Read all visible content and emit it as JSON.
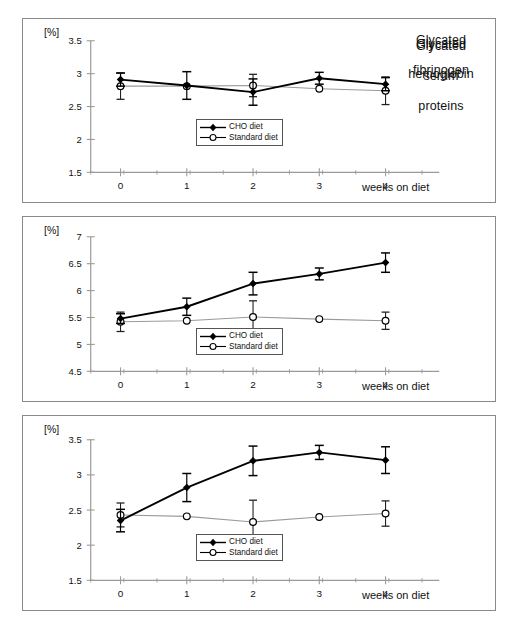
{
  "figure": {
    "unit_label": "[%]",
    "x_axis_title": "weeks on diet",
    "legend": {
      "series1_label": "CHO diet",
      "series2_label": "Standard diet",
      "series1_marker": "filled-diamond-icon",
      "series2_marker": "open-circle-icon"
    },
    "colors": {
      "series1": "#000000",
      "series2": "#000000",
      "series2_line": "#9a9a9a",
      "axis": "#9a9a9a",
      "frame": "#8a8a8a",
      "text": "#111111"
    }
  },
  "chart_data": [
    {
      "type": "line",
      "title": "Glycated\nhemoglobin",
      "title_line1": "Glycated",
      "title_line2": "hemoglobin",
      "xlabel": "weeks on diet",
      "ylabel": "[%]",
      "categories": [
        0,
        1,
        2,
        3,
        4
      ],
      "x": [
        0,
        1,
        2,
        3,
        4
      ],
      "xlim": [
        -0.45,
        4.6
      ],
      "ylim": [
        1.5,
        3.5
      ],
      "yticks": [
        1.5,
        2,
        2.5,
        3,
        3.5
      ],
      "ytick_labels": [
        "1.5",
        "2",
        "2.5",
        "3",
        "3.5"
      ],
      "xtick_labels": [
        "0",
        "1",
        "2",
        "3",
        "4"
      ],
      "grid": false,
      "legend_position": "right-lower",
      "series": [
        {
          "name": "CHO diet",
          "marker": "filled-diamond",
          "values": [
            2.91,
            2.82,
            2.72,
            2.93,
            2.84
          ],
          "errors": [
            0.1,
            0.21,
            0.2,
            0.09,
            0.1
          ]
        },
        {
          "name": "Standard diet",
          "marker": "open-circle",
          "values": [
            2.81,
            2.81,
            2.82,
            2.77,
            2.74
          ],
          "errors": [
            0.2,
            0.0,
            0.17,
            0.0,
            0.21
          ]
        }
      ]
    },
    {
      "type": "line",
      "title": "Glycated\nserum\nproteins",
      "title_line1": "Glycated",
      "title_line2": "serum",
      "title_line3": "proteins",
      "xlabel": "weeks on diet",
      "ylabel": "[%]",
      "categories": [
        0,
        1,
        2,
        3,
        4
      ],
      "x": [
        0,
        1,
        2,
        3,
        4
      ],
      "xlim": [
        -0.45,
        4.6
      ],
      "ylim": [
        4.5,
        7
      ],
      "yticks": [
        4.5,
        5,
        5.5,
        6,
        6.5,
        7
      ],
      "ytick_labels": [
        "4.5",
        "5",
        "5.5",
        "6",
        "6.5",
        "7"
      ],
      "xtick_labels": [
        "0",
        "1",
        "2",
        "3",
        "4"
      ],
      "grid": false,
      "legend_position": "right-lower",
      "series": [
        {
          "name": "CHO diet",
          "marker": "filled-diamond",
          "values": [
            5.48,
            5.7,
            6.13,
            6.31,
            6.52
          ],
          "errors": [
            0.09,
            0.16,
            0.21,
            0.11,
            0.18
          ]
        },
        {
          "name": "Standard diet",
          "marker": "open-circle",
          "values": [
            5.42,
            5.44,
            5.51,
            5.47,
            5.44
          ],
          "errors": [
            0.18,
            0.0,
            0.3,
            0.0,
            0.16
          ]
        }
      ]
    },
    {
      "type": "line",
      "title": "Glycated\nfibrinogen",
      "title_line1": "Glycated",
      "title_line2": "fibrinogen",
      "xlabel": "weeks on diet",
      "ylabel": "[%]",
      "categories": [
        0,
        1,
        2,
        3,
        4
      ],
      "x": [
        0,
        1,
        2,
        3,
        4
      ],
      "xlim": [
        -0.45,
        4.6
      ],
      "ylim": [
        1.5,
        3.5
      ],
      "yticks": [
        1.5,
        2,
        2.5,
        3,
        3.5
      ],
      "ytick_labels": [
        "1.5",
        "2",
        "2.5",
        "3",
        "3.5"
      ],
      "xtick_labels": [
        "0",
        "1",
        "2",
        "3",
        "4"
      ],
      "grid": false,
      "legend_position": "right-lower",
      "series": [
        {
          "name": "CHO diet",
          "marker": "filled-diamond",
          "values": [
            2.35,
            2.82,
            3.2,
            3.32,
            3.21
          ],
          "errors": [
            0.16,
            0.2,
            0.21,
            0.1,
            0.19
          ]
        },
        {
          "name": "Standard diet",
          "marker": "open-circle",
          "values": [
            2.43,
            2.41,
            2.33,
            2.4,
            2.45
          ],
          "errors": [
            0.17,
            0.0,
            0.31,
            0.0,
            0.18
          ]
        }
      ]
    }
  ]
}
